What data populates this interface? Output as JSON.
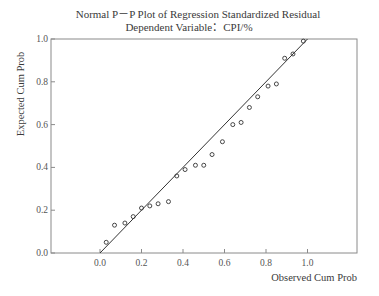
{
  "chart_data": {
    "type": "scatter",
    "title": "Normal P－P Plot of Regression Standardized Residual",
    "subtitle": "Dependent Variable：CPI/%",
    "xlabel": "Observed Cum Prob",
    "ylabel": "Expected Cum Prob",
    "xlim": [
      0.0,
      1.0
    ],
    "ylim": [
      0.0,
      1.0
    ],
    "x_ticks": [
      "0.0",
      "0.2",
      "0.4",
      "0.6",
      "0.8",
      "1.0"
    ],
    "y_ticks": [
      "0.0",
      "0.2",
      "0.4",
      "0.6",
      "0.8",
      "1.0"
    ],
    "grid": false,
    "legend": null,
    "series": [
      {
        "name": "Standardized Residuals",
        "marker": "open-circle",
        "x": [
          0.03,
          0.07,
          0.12,
          0.16,
          0.2,
          0.24,
          0.28,
          0.33,
          0.37,
          0.41,
          0.46,
          0.5,
          0.54,
          0.59,
          0.64,
          0.68,
          0.72,
          0.76,
          0.81,
          0.85,
          0.89,
          0.93,
          0.98
        ],
        "y": [
          0.05,
          0.13,
          0.14,
          0.17,
          0.21,
          0.22,
          0.23,
          0.24,
          0.36,
          0.39,
          0.41,
          0.41,
          0.46,
          0.52,
          0.6,
          0.61,
          0.68,
          0.73,
          0.78,
          0.79,
          0.91,
          0.93,
          0.99
        ]
      }
    ],
    "reference_line": {
      "name": "Diagonal",
      "x": [
        0.0,
        1.0
      ],
      "y": [
        0.0,
        1.0
      ]
    }
  },
  "colors": {
    "frame": "#8a8a8a",
    "line": "#333333",
    "marker": "#333333",
    "text": "#3a3a3a"
  }
}
